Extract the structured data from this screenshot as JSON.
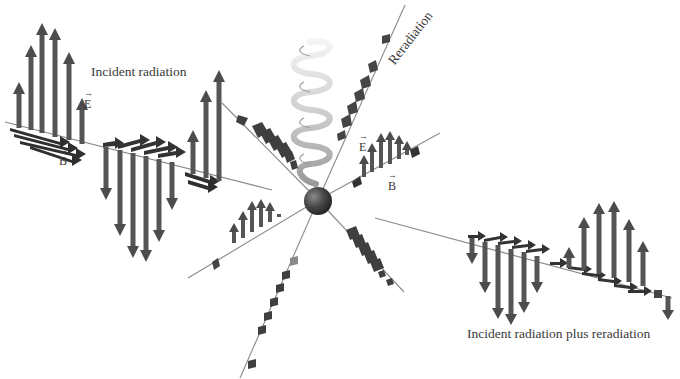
{
  "figure": {
    "labels": {
      "incident": "Incident radiation",
      "reradiation": "Reradiation",
      "sum": "Incident radiation plus reradiation",
      "e_field_left": "E",
      "b_field_left": "B",
      "e_field_right": "E",
      "b_field_right": "B",
      "vector_mark": "⃗"
    },
    "colors": {
      "arrow_fill": "#5a5a5a",
      "arrow_dark": "#2e2e2e",
      "axis_line": "#8a8a8a",
      "spring": "#d8d8d8",
      "charge": "#3c3c3c",
      "text": "#3a3a3a"
    },
    "elements": {
      "incident_wave": "E-field up/down arrows with B-field horizontal arrows traveling along incoming axis",
      "charge": "sphere at origin suspended by spring",
      "spring": "vertical helical spring above charge",
      "reradiated_waves": "smaller wave packets radiating outward along 6 axes",
      "output_wave": "combined incident plus reradiated wave on far right"
    }
  }
}
